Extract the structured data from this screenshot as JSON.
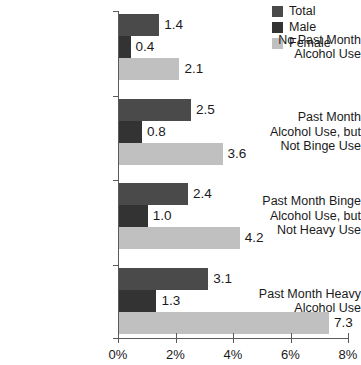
{
  "chart_data": {
    "type": "bar",
    "orientation": "horizontal",
    "title": "",
    "xlabel": "",
    "ylabel": "",
    "xlim": [
      0,
      8
    ],
    "xtick_labels": [
      "0%",
      "2%",
      "4%",
      "6%",
      "8%"
    ],
    "xtick_values": [
      0,
      2,
      4,
      6,
      8
    ],
    "grid": false,
    "legend_position": "top-right",
    "categories": [
      "No Past Month Alcohol Use",
      "Past Month Alcohol Use, but Not Binge Use",
      "Past Month Binge Alcohol Use, but Not Heavy Use",
      "Past Month Heavy Alcohol Use"
    ],
    "category_lines": [
      [
        "No Past Month",
        "Alcohol Use"
      ],
      [
        "Past Month",
        "Alcohol Use, but",
        "Not Binge Use"
      ],
      [
        "Past Month Binge",
        "Alcohol Use, but",
        "Not Heavy Use"
      ],
      [
        "Past Month Heavy",
        "Alcohol Use"
      ]
    ],
    "series": [
      {
        "name": "Total",
        "color": "#4a4a4a",
        "values": [
          1.4,
          2.5,
          2.4,
          3.1
        ],
        "value_labels": [
          "1.4",
          "2.5",
          "2.4",
          "3.1"
        ]
      },
      {
        "name": "Male",
        "color": "#333333",
        "values": [
          0.4,
          0.8,
          1.0,
          1.3
        ],
        "value_labels": [
          "0.4",
          "0.8",
          "1.0",
          "1.3"
        ]
      },
      {
        "name": "Female",
        "color": "#c0c0c0",
        "values": [
          2.1,
          3.6,
          4.2,
          7.3
        ],
        "value_labels": [
          "2.1",
          "3.6",
          "4.2",
          "7.3"
        ]
      }
    ]
  },
  "legend": {
    "items": [
      {
        "label": "Total",
        "color": "#4a4a4a"
      },
      {
        "label": "Male",
        "color": "#333333"
      },
      {
        "label": "Female",
        "color": "#c0c0c0"
      }
    ]
  },
  "axis": {
    "line_color": "#5a5a5a"
  }
}
